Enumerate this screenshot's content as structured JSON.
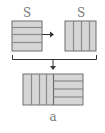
{
  "diagram": {
    "top_left_label": "S",
    "top_right_label": "S",
    "bottom_label": "a",
    "colors": {
      "fill": "#d6d6d6",
      "line": "#8a8a8a",
      "frame": "#6e6e6e",
      "arrow": "#333333",
      "text": "#7a7a7a"
    },
    "nodes": [
      {
        "id": "left-block",
        "pattern": "horizontal-stripes",
        "stripes": 4
      },
      {
        "id": "right-block",
        "pattern": "vertical-stripes",
        "stripes": 4
      },
      {
        "id": "combined-block",
        "pattern": "vertical-left-horizontal-right",
        "stripes_left": 4,
        "stripes_right": 4
      }
    ],
    "edges": [
      {
        "from": "left-block",
        "to": "right-block",
        "type": "arrow"
      },
      {
        "from": "left-block+right-block",
        "to": "combined-block",
        "type": "bracket-arrow"
      }
    ]
  }
}
